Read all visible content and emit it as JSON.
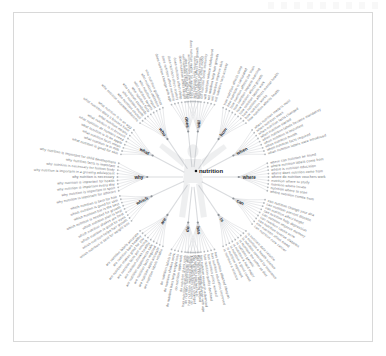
{
  "page": {
    "background": "#ffffff",
    "frame_border_color": "#d8d8d8"
  },
  "diagram": {
    "type": "radial-dendrogram",
    "center_label": "nutrition",
    "center_figure": "human-body-silhouette",
    "leaf_color": "#6f7276",
    "hub_color": "#2a2d31",
    "link_color": "#d2d5d8",
    "hubs": [
      {
        "label": "why",
        "angle": 180,
        "count": 9
      },
      {
        "label": "where",
        "angle": 0,
        "count": 9
      },
      {
        "label": "which",
        "angle": 205,
        "count": 9
      },
      {
        "label": "what",
        "angle": 152,
        "count": 9
      },
      {
        "label": "when",
        "angle": 28,
        "count": 9
      },
      {
        "label": "can",
        "angle": 332,
        "count": 9
      },
      {
        "label": "who",
        "angle": 124,
        "count": 9
      },
      {
        "label": "how",
        "angle": 56,
        "count": 9
      },
      {
        "label": "are",
        "angle": 236,
        "count": 9
      },
      {
        "label": "is",
        "angle": 304,
        "count": 9
      },
      {
        "label": "does",
        "angle": 96,
        "count": 9
      },
      {
        "label": "will",
        "angle": 84,
        "count": 9
      },
      {
        "label": "do",
        "angle": 264,
        "count": 9
      },
      {
        "label": "has",
        "angle": 276,
        "count": 9
      }
    ],
    "branches": [
      {
        "hub": "why",
        "leaves": [
          "why nutrition is important for child development",
          "why nutrition facts is important",
          "why nutrition is necessary for human body",
          "why nutrition is important in a growing adolescent",
          "why nutrition is necessary",
          "why nutrition is important for health",
          "why nutrition is important every day",
          "why nutrition is important in sport",
          "why nutrition is important for athletes"
        ]
      },
      {
        "hub": "where",
        "leaves": [
          "where nutrition comes from",
          "nutrition where to start",
          "nutrition where locate",
          "nutrition where to study",
          "where do nutrition vouchers work",
          "where does nutrition come from",
          "where is nutrition education",
          "where nutrition labels come from",
          "where can nutrition be found"
        ]
      },
      {
        "hub": "which",
        "leaves": [
          "which nutrition is best for hair",
          "which nutrition is good for skin",
          "which nutrition bar is the best",
          "which nutrition is needed for growth",
          "which nutrition plan is best",
          "which nutrition shakes are best",
          "which nutrition is good for eyes",
          "which nutrition helps hair growth",
          "which nutrition is best for weight loss"
        ]
      },
      {
        "hub": "what",
        "leaves": [
          "what nutrition is in an egg",
          "what nutrition does a banana have",
          "what nutrition means",
          "what nutrition is in broccoli",
          "what nutrition do humans need",
          "what nutrition is in an apple",
          "what nutrition facts mean",
          "what nutrition is in milk",
          "what nutrition is good for skin"
        ]
      },
      {
        "hub": "when",
        "leaves": [
          "when nutrition labels were introduced",
          "when nutrition facts required",
          "when nutrition month",
          "when nutrition is important",
          "when nutrition labels became mandatory",
          "when nutrition started",
          "when nutrition facts changed",
          "when nutrition week",
          "when nutrition matters most"
        ]
      },
      {
        "hub": "can",
        "leaves": [
          "can nutrition cure cancer",
          "can nutrition affect mood",
          "can nutrition reverse diabetes",
          "can nutrition cause acne",
          "can nutrition improve memory",
          "can nutrition help depression",
          "can nutrition affect height",
          "can nutrition prevent disease",
          "can nutrition change your dna"
        ]
      },
      {
        "hub": "who",
        "leaves": [
          "who nutrition guidelines",
          "who nutrition definition",
          "who nutrition report",
          "who nutrition targets",
          "who nutrition facts",
          "who nutrition standards",
          "who nutrition month",
          "who nutrition council",
          "who nutrition recommendations"
        ]
      },
      {
        "hub": "how",
        "leaves": [
          "how nutrition affects health",
          "how nutrition works",
          "how nutrition affects mental health",
          "how nutrition labels work",
          "how nutrition affects growth",
          "how nutrition impacts learning",
          "how nutrition affects the brain",
          "how nutrition is calculated",
          "how nutrition affects sleep"
        ]
      },
      {
        "hub": "are",
        "leaves": [
          "are nutrition labels accurate",
          "are nutrition bars healthy",
          "are nutrition shakes good for you",
          "are nutrition facts per serving",
          "are nutrition drinks healthy",
          "are nutrition supplements safe",
          "are nutrition facts required",
          "are nutrition apps accurate",
          "are nutrition labels reliable"
        ]
      },
      {
        "hub": "is",
        "leaves": [
          "is nutrition a science",
          "is nutrition important",
          "is nutrition a good career",
          "is nutrition a hard major",
          "is nutrition genetic",
          "is nutrition the same as diet",
          "is nutrition covered by insurance",
          "is nutrition a health science",
          "is nutrition data reliable"
        ]
      },
      {
        "hub": "does",
        "leaves": [
          "does nutrition affect mood",
          "does nutrition affect hair growth",
          "does nutrition matter for weight loss",
          "does nutrition affect skin",
          "does nutrition affect height",
          "does nutrition affect sleep",
          "does nutrition affect anxiety",
          "does nutrition affect memory",
          "does nutrition change with age"
        ]
      },
      {
        "hub": "will",
        "leaves": [
          "will nutrition help anxiety",
          "will nutrition improve skin",
          "will nutrition help hair growth",
          "will nutrition reduce cholesterol",
          "will nutrition boost immunity",
          "will nutrition affect energy",
          "will nutrition help recovery",
          "will nutrition prevent illness",
          "will nutrition change my life"
        ]
      },
      {
        "hub": "do",
        "leaves": [
          "do nutrition labels lie",
          "do nutrition shakes work",
          "do nutrition bars help weight loss",
          "do nutrition apps work",
          "do nutrition plans work",
          "do nutrition facts include fiber",
          "do nutrition supplements work",
          "do nutrition coaches help",
          "do nutrition needs change with age"
        ]
      },
      {
        "hub": "has",
        "leaves": [
          "has nutrition changed over time",
          "has nutrition improved globally",
          "has nutrition science changed",
          "has nutrition labelling helped",
          "has nutrition research advanced",
          "has nutrition quality declined",
          "has nutrition policy worked",
          "has nutrition education improved",
          "has nutrition affected lifespan"
        ]
      }
    ]
  }
}
